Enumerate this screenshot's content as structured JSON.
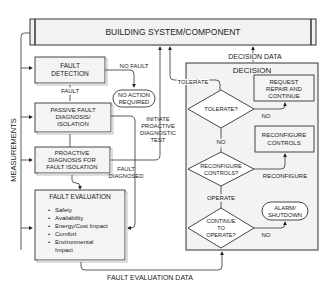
{
  "top_box": {
    "label": "BUILDING SYSTEM/COMPONENT"
  },
  "side_label": "MEASUREMENTS",
  "fault_detection": {
    "line1": "FAULT",
    "line2": "DETECTION"
  },
  "no_fault_label": "NO FAULT",
  "no_action": {
    "line1": "NO ACTION",
    "line2": "REQUIRED"
  },
  "fault_label": "FAULT",
  "passive": {
    "line1": "PASSIVE FAULT",
    "line2": "DIAGNOSIS/",
    "line3": "ISOLATION"
  },
  "initiate": {
    "line1": "INITIATE",
    "line2": "PROACTIVE",
    "line3": "DIAGNOSTIC",
    "line4": "TEST"
  },
  "proactive": {
    "line1": "PROACTIVE",
    "line2": "DIAGNOSIS FOR",
    "line3": "FAULT ISOLATION"
  },
  "fault_diagnosed": {
    "line1": "FAULT",
    "line2": "DIAGNOSED"
  },
  "fault_evaluation": {
    "title": "FAULT EVALUATION",
    "items": [
      "Safety",
      "Availability",
      "Energy/Cost Impact",
      "Comfort",
      "Environmental",
      "Impact"
    ]
  },
  "fault_evaluation_data": "FAULT EVALUATION DATA",
  "decision_data": "DECISION DATA",
  "decision": {
    "title": "DECISION",
    "tolerate_label": "TOLERATE",
    "tolerate_q": "TOLERATE?",
    "no1": "NO",
    "no2": "NO",
    "no3": "NO",
    "request": {
      "line1": "REQUEST",
      "line2": "REPAIR AND",
      "line3": "CONTINUE"
    },
    "reconfigure_controls": {
      "line1": "RECONFIGURE",
      "line2": "CONTROLS"
    },
    "reconfigure_q": {
      "line1": "RECONFIGURE",
      "line2": "CONTROLS?"
    },
    "reconfigure_label": "RECONFIGURE",
    "operate_label": "OPERATE",
    "continue_q": {
      "line1": "CONTINUE",
      "line2": "TO",
      "line3": "OPERATE?"
    },
    "alarm": {
      "line1": "ALARM/",
      "line2": "SHUTDOWN"
    }
  }
}
